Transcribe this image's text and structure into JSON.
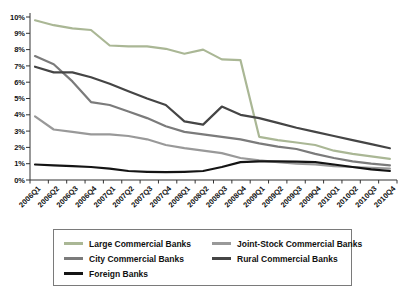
{
  "chart_data": {
    "type": "line",
    "xlabel": "",
    "ylabel": "",
    "ylim": [
      0,
      10
    ],
    "grid": false,
    "legend_position": "bottom-box",
    "y_ticks": [
      "0%",
      "1%",
      "2%",
      "3%",
      "4%",
      "5%",
      "6%",
      "7%",
      "8%",
      "9%",
      "10%"
    ],
    "x_categories": [
      "2006Q1",
      "2006Q2",
      "2006Q3",
      "2006Q4",
      "2007Q1",
      "2007Q2",
      "2007Q3",
      "2007Q4",
      "2008Q1",
      "2008Q2",
      "2008Q3",
      "2008Q4",
      "2009Q1",
      "2009Q2",
      "2009Q3",
      "2009Q4",
      "2010Q1",
      "2010Q2",
      "2010Q3",
      "2010Q4"
    ],
    "series": [
      {
        "name": "Large Commercial Banks",
        "color": "#aab795",
        "values": [
          9.8,
          9.5,
          9.3,
          9.2,
          8.25,
          8.2,
          8.2,
          8.05,
          7.75,
          8.0,
          7.4,
          7.35,
          2.65,
          2.45,
          2.3,
          2.15,
          1.8,
          1.6,
          1.45,
          1.3
        ]
      },
      {
        "name": "Joint-Stock Commercial Banks",
        "color": "#999999",
        "values": [
          3.9,
          3.1,
          2.95,
          2.8,
          2.8,
          2.7,
          2.5,
          2.15,
          1.95,
          1.8,
          1.65,
          1.35,
          1.2,
          1.1,
          1.0,
          0.95,
          0.85,
          0.8,
          0.75,
          0.7
        ]
      },
      {
        "name": "City Commercial Banks",
        "color": "#7b7b7b",
        "values": [
          7.6,
          7.1,
          6.05,
          4.78,
          4.6,
          4.2,
          3.8,
          3.3,
          2.95,
          2.8,
          2.65,
          2.5,
          2.25,
          2.05,
          1.9,
          1.6,
          1.35,
          1.15,
          1.0,
          0.9
        ]
      },
      {
        "name": "Rural Commercial Banks",
        "color": "#454545",
        "values": [
          6.95,
          6.6,
          6.6,
          6.3,
          5.9,
          5.45,
          5.0,
          4.6,
          3.6,
          3.4,
          4.5,
          4.0,
          3.8,
          3.5,
          3.2,
          2.95,
          2.7,
          2.45,
          2.2,
          1.95
        ]
      },
      {
        "name": "Foreign Banks",
        "color": "#141414",
        "values": [
          0.95,
          0.9,
          0.85,
          0.8,
          0.7,
          0.55,
          0.5,
          0.48,
          0.5,
          0.55,
          0.8,
          1.1,
          1.15,
          1.15,
          1.12,
          1.1,
          0.95,
          0.8,
          0.65,
          0.55
        ]
      }
    ]
  },
  "legend": {
    "items": [
      "Large Commercial Banks",
      "Joint-Stock Commercial Banks",
      "City Commercial Banks",
      "Rural Commercial Banks",
      "Foreign Banks"
    ]
  }
}
